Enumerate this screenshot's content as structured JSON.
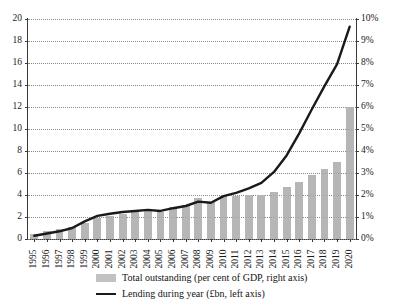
{
  "chart_data": {
    "type": "bar",
    "title": "",
    "subtitle": "",
    "xlabel": "",
    "ylabel": "",
    "grid": true,
    "legend_position": "bottom",
    "categories": [
      "1995",
      "1996",
      "1997",
      "1998",
      "1999",
      "2000",
      "2001",
      "2002",
      "2003",
      "2004",
      "2005",
      "2006",
      "2007",
      "2008",
      "2009",
      "2010",
      "2011",
      "2012",
      "2013",
      "2014",
      "2015",
      "2016",
      "2017",
      "2018",
      "2019",
      "2020"
    ],
    "axes": {
      "left": {
        "label": "Lending during year (£bn)",
        "min": 0,
        "max": 20,
        "step": 2,
        "ticks": [
          "0",
          "2",
          "4",
          "6",
          "8",
          "10",
          "12",
          "14",
          "16",
          "18",
          "20"
        ]
      },
      "right": {
        "label": "Total outstanding (per cent of GDP)",
        "min": 0,
        "max": 10,
        "step": 1,
        "unit": "%",
        "ticks": [
          "0%",
          "1%",
          "2%",
          "3%",
          "4%",
          "5%",
          "6%",
          "7%",
          "8%",
          "9%",
          "10%"
        ]
      }
    },
    "series": [
      {
        "name": "Total outstanding (per cent of GDP, right axis)",
        "type": "bar",
        "axis": "right",
        "unit": "%",
        "color": "#b6b6b6",
        "values": [
          0.25,
          0.35,
          0.45,
          0.55,
          0.75,
          0.95,
          1.05,
          1.15,
          1.25,
          1.35,
          1.25,
          1.45,
          1.55,
          1.85,
          1.7,
          1.95,
          1.95,
          2.0,
          2.0,
          2.15,
          2.35,
          2.6,
          2.9,
          3.2,
          3.5,
          6.0
        ]
      },
      {
        "name": "Lending during year (£bn, left axis)",
        "type": "line",
        "axis": "left",
        "unit": "£bn",
        "color": "#1a1a1a",
        "values": [
          0.3,
          0.5,
          0.7,
          1.0,
          1.6,
          2.1,
          2.3,
          2.45,
          2.55,
          2.65,
          2.55,
          2.8,
          3.0,
          3.4,
          3.3,
          3.9,
          4.2,
          4.6,
          5.1,
          6.1,
          7.6,
          9.6,
          11.8,
          13.9,
          15.9,
          19.3
        ]
      }
    ]
  },
  "legend": {
    "items": [
      {
        "marker": "bar-swatch",
        "label": "Total outstanding (per cent of GDP, right axis)"
      },
      {
        "marker": "line-swatch",
        "label": "Lending during year (£bn, left axis)"
      }
    ]
  },
  "colors": {
    "bar": "#b6b6b6",
    "line": "#1a1a1a",
    "grid": "#8a8a8a",
    "axis": "#3a3a3a",
    "background": "#ffffff"
  }
}
